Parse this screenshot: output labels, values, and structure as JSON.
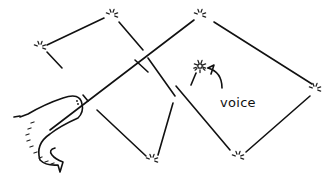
{
  "diagram": {
    "width": 333,
    "height": 175,
    "background": "#ffffff",
    "ink": "#111111",
    "label_voice": "voice",
    "label_voice_pos": [
      220,
      95
    ],
    "nodes": [
      {
        "id": "n-left",
        "x": 40,
        "y": 47
      },
      {
        "id": "n-top-left",
        "x": 112,
        "y": 15
      },
      {
        "id": "n-top-right",
        "x": 200,
        "y": 15
      },
      {
        "id": "n-right",
        "x": 315,
        "y": 89
      },
      {
        "id": "n-bottom-mid",
        "x": 152,
        "y": 160
      },
      {
        "id": "n-bottom-right",
        "x": 238,
        "y": 157
      },
      {
        "id": "n-voice",
        "x": 200,
        "y": 66
      }
    ],
    "edges": [
      {
        "from": [
          47,
          45
        ],
        "to": [
          104,
          18
        ]
      },
      {
        "from": [
          47,
          52
        ],
        "to": [
          62,
          68
        ]
      },
      {
        "from": [
          119,
          22
        ],
        "to": [
          143,
          50
        ]
      },
      {
        "from": [
          148,
          58
        ],
        "to": [
          175,
          96
        ]
      },
      {
        "from": [
          214,
          22
        ],
        "to": [
          312,
          84
        ]
      },
      {
        "from": [
          194,
          20
        ],
        "to": [
          50,
          130
        ]
      },
      {
        "from": [
          83,
          95
        ],
        "to": [
          88,
          101
        ]
      },
      {
        "from": [
          97,
          110
        ],
        "to": [
          146,
          156
        ]
      },
      {
        "from": [
          173,
          103
        ],
        "to": [
          158,
          155
        ]
      },
      {
        "from": [
          135,
          60
        ],
        "to": [
          148,
          72
        ]
      },
      {
        "from": [
          176,
          86
        ],
        "to": [
          230,
          150
        ]
      },
      {
        "from": [
          310,
          96
        ],
        "to": [
          246,
          152
        ]
      },
      {
        "from": [
          196,
          73
        ],
        "to": [
          191,
          85
        ]
      }
    ],
    "serpent": {
      "body_path": "M 20 117 L 28 114 Q 45 104 63 98 Q 80 92 82 104 Q 84 112 78 118 Q 60 126 50 134 Q 35 144 40 160 Q 46 166 58 165 L 60 172 L 63 162 Q 55 159 52 155 Q 48 150 55 148",
      "tail_mark": [
        [
          14,
          117
        ],
        [
          20,
          116
        ]
      ],
      "eye": [
        [
          77,
          101
        ],
        [
          78,
          104
        ]
      ],
      "scales": [
        [
          34,
          122
        ],
        [
          31,
          128
        ],
        [
          29,
          134
        ],
        [
          30,
          140
        ],
        [
          33,
          146
        ],
        [
          37,
          152
        ],
        [
          42,
          157
        ],
        [
          48,
          161
        ],
        [
          54,
          163
        ]
      ]
    },
    "arrow": {
      "path": "M 222 88 Q 222 72 208 68",
      "head": [
        [
          208,
          68
        ],
        [
          214,
          65
        ],
        [
          211,
          74
        ]
      ]
    }
  }
}
